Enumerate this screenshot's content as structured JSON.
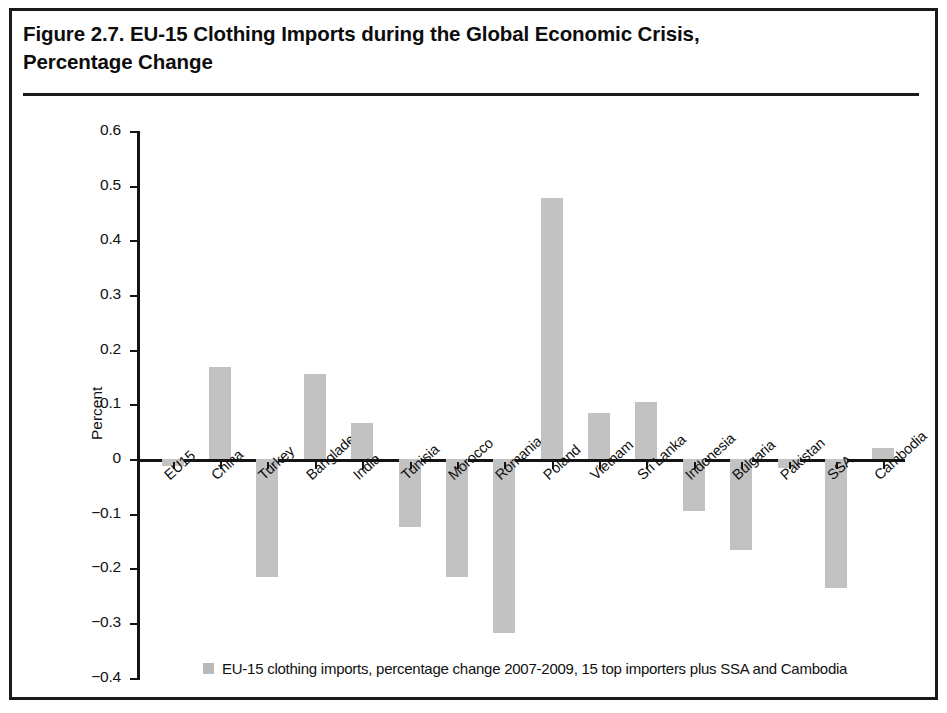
{
  "figure": {
    "title": "Figure 2.7. EU-15 Clothing Imports during the Global Economic Crisis,\nPercentage Change"
  },
  "chart_data": {
    "type": "bar",
    "title": "Figure 2.7. EU-15 Clothing Imports during the Global Economic Crisis, Percentage Change",
    "xlabel": "",
    "ylabel": "Percent",
    "ylim": [
      -0.4,
      0.6
    ],
    "ytick_labels": [
      "0.6",
      "0.5",
      "0.4",
      "0.3",
      "0.2",
      "0.1",
      "0",
      "−0.1",
      "−0.2",
      "−0.3",
      "−0.4"
    ],
    "ytick_values": [
      0.6,
      0.5,
      0.4,
      0.3,
      0.2,
      0.1,
      0,
      -0.1,
      -0.2,
      -0.3,
      -0.4
    ],
    "grid": false,
    "legend_position": "bottom",
    "bar_color": "#c2c2c2",
    "categories": [
      "EU15",
      "China",
      "Turkey",
      "Bangladesh",
      "India",
      "Tunisia",
      "Morocco",
      "Romania",
      "Poland",
      "Vietnam",
      "Sri Lanka",
      "Indonesia",
      "Bulgaria",
      "Pakistan",
      "SSA",
      "Cambodia"
    ],
    "values": [
      -0.012,
      0.169,
      -0.216,
      0.155,
      0.065,
      -0.125,
      -0.216,
      -0.318,
      0.478,
      0.084,
      0.104,
      -0.096,
      -0.166,
      -0.017,
      -0.236,
      0.02
    ],
    "series": [
      {
        "name": "EU-15 clothing imports, percentage change 2007-2009, 15 top importers plus SSA and Cambodia",
        "values": [
          -0.012,
          0.169,
          -0.216,
          0.155,
          0.065,
          -0.125,
          -0.216,
          -0.318,
          0.478,
          0.084,
          0.104,
          -0.096,
          -0.166,
          -0.017,
          -0.236,
          0.02
        ]
      }
    ],
    "legend": [
      "EU-15 clothing imports, percentage change 2007-2009, 15 top importers plus SSA and Cambodia"
    ]
  }
}
